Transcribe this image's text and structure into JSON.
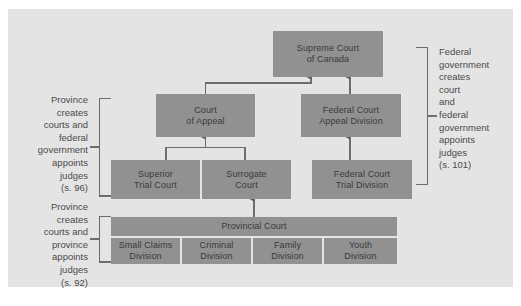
{
  "diagram": {
    "background_color": "#e7e7e7",
    "node_color": "#919191",
    "text_color": "#3a3a3a",
    "line_color": "#6d6d6d",
    "nodes": {
      "supreme_court": "Supreme Court\nof Canada",
      "court_of_appeal": "Court\nof Appeal",
      "federal_court_appeal": "Federal Court\nAppeal Division",
      "superior_trial_court": "Superior\nTrial Court",
      "surrogate_court": "Surrogate\nCourt",
      "federal_court_trial": "Federal Court\nTrial Division",
      "provincial_court": "Provincial Court",
      "small_claims_division": "Small Claims\nDivision",
      "criminal_division": "Criminal\nDivision",
      "family_division": "Family\nDivision",
      "youth_division": "Youth\nDivision"
    },
    "annotations": {
      "left_upper": "Province\ncreates\ncourts and\nfederal\ngovernment\nappoints\njudges\n(s. 96)",
      "left_lower": "Province\ncreates\ncourts and\nprovince\nappoints\njudges\n(s. 92)",
      "right": "Federal\ngovernment\ncreates\ncourt\nand\nfederal\ngovernment\nappoints\njudges\n(s. 101)"
    }
  }
}
